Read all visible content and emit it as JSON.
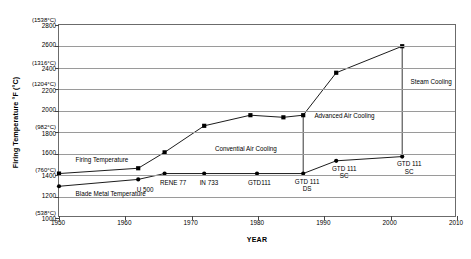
{
  "chart_data": {
    "type": "line",
    "title": "",
    "xlabel": "YEAR",
    "ylabel": "Firing Temperature °F (°C)",
    "xlim": [
      1950,
      2010
    ],
    "ylim": [
      1000,
      2800
    ],
    "grid": true,
    "legend": "none",
    "x_ticks": [
      "1950",
      "1960",
      "1970",
      "1980",
      "1990",
      "2000",
      "2010"
    ],
    "x_tick_values": [
      1950,
      1960,
      1970,
      1980,
      1990,
      2000,
      2010
    ],
    "y_ticks": [
      {
        "value": 1000,
        "fahrenheit": "1000",
        "celsius": "(538°C)"
      },
      {
        "value": 1200,
        "fahrenheit": "1200",
        "celsius": ""
      },
      {
        "value": 1400,
        "fahrenheit": "1400",
        "celsius": "(760°C)"
      },
      {
        "value": 1600,
        "fahrenheit": "1600",
        "celsius": ""
      },
      {
        "value": 1800,
        "fahrenheit": "1800",
        "celsius": "(982°C)"
      },
      {
        "value": 2000,
        "fahrenheit": "2000",
        "celsius": ""
      },
      {
        "value": 2200,
        "fahrenheit": "2200",
        "celsius": "(1204°C)"
      },
      {
        "value": 2400,
        "fahrenheit": "2400",
        "celsius": "(1316°C)"
      },
      {
        "value": 2600,
        "fahrenheit": "2600",
        "celsius": ""
      },
      {
        "value": 2800,
        "fahrenheit": "2800",
        "celsius": "(1538°C)"
      }
    ],
    "series": [
      {
        "name": "Firing Temperature",
        "marker": "square",
        "color": "#000000",
        "points": [
          {
            "x": 1950,
            "y": 1400
          },
          {
            "x": 1962,
            "y": 1450
          },
          {
            "x": 1966,
            "y": 1600
          },
          {
            "x": 1972,
            "y": 1850
          },
          {
            "x": 1979,
            "y": 1950
          },
          {
            "x": 1984,
            "y": 1930
          },
          {
            "x": 1987,
            "y": 1950
          },
          {
            "x": 1992,
            "y": 2350
          },
          {
            "x": 2002,
            "y": 2600
          }
        ]
      },
      {
        "name": "Blade Metal Temperature",
        "marker": "circle",
        "color": "#000000",
        "points": [
          {
            "x": 1950,
            "y": 1280
          },
          {
            "x": 1962,
            "y": 1345
          },
          {
            "x": 1966,
            "y": 1400
          },
          {
            "x": 1972,
            "y": 1400
          },
          {
            "x": 1980,
            "y": 1400
          },
          {
            "x": 1987,
            "y": 1400
          },
          {
            "x": 1992,
            "y": 1520
          },
          {
            "x": 2002,
            "y": 1560
          }
        ]
      }
    ],
    "connector_lines": [
      {
        "x": 1987,
        "y_from": 1400,
        "y_to": 1950
      },
      {
        "x": 2002,
        "y_from": 1560,
        "y_to": 2600
      }
    ],
    "annotations": [
      {
        "id": "firing-temperature-label",
        "text": "Firing Temperature",
        "x": 1952.5,
        "y": 1545,
        "align": "left"
      },
      {
        "id": "blade-metal-temperature-label",
        "text": "Blade Metal Temperature",
        "x": 1952.5,
        "y": 1225,
        "align": "left"
      },
      {
        "id": "convential-air-cooling-label",
        "text": "Convential Air Cooling",
        "x": 1973.5,
        "y": 1640,
        "align": "left"
      },
      {
        "id": "advanced-air-cooling-label",
        "text": "Advanced Air Cooling",
        "x": 1988.5,
        "y": 1950,
        "align": "left"
      },
      {
        "id": "steam-cooling-label",
        "text": "Steam Cooling",
        "x": 2003.0,
        "y": 2270,
        "align": "left"
      },
      {
        "id": "alloy-u500-label",
        "text": "U 500",
        "x": 1963.0,
        "y": 1265,
        "align": "center"
      },
      {
        "id": "alloy-rene77-label",
        "text": "RENE 77",
        "x": 1967.2,
        "y": 1325,
        "align": "center"
      },
      {
        "id": "alloy-in733-label",
        "text": "IN 733",
        "x": 1972.6,
        "y": 1325,
        "align": "center"
      },
      {
        "id": "alloy-gtd111-label",
        "text": "GTD111",
        "x": 1980.2,
        "y": 1325,
        "align": "center"
      },
      {
        "id": "alloy-gtd111-ds-label",
        "text": "GTD 111\nDS",
        "x": 1987.4,
        "y": 1340,
        "align": "center"
      },
      {
        "id": "alloy-gtd111-sc-1-label",
        "text": "GTD 111\nSC",
        "x": 1993.0,
        "y": 1455,
        "align": "center"
      },
      {
        "id": "alloy-gtd111-sc-2-label",
        "text": "GTD 111\nSC",
        "x": 2002.8,
        "y": 1500,
        "align": "center"
      }
    ]
  }
}
